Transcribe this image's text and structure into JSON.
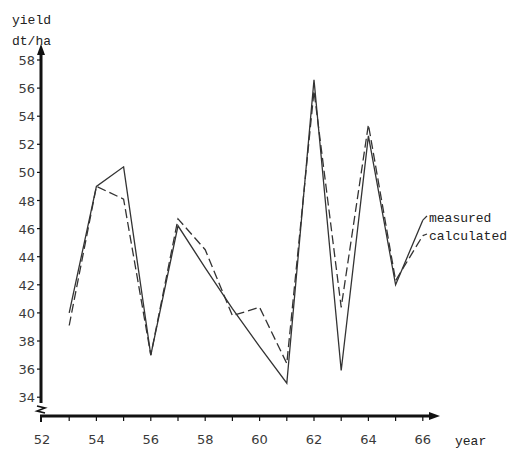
{
  "chart_data": {
    "type": "line",
    "title": "",
    "xlabel": "year",
    "ylabel_line1": "yield",
    "ylabel_line2": "dt/ha",
    "xlim": [
      52,
      66
    ],
    "ylim": [
      34,
      58
    ],
    "y_axis_break": true,
    "grid": false,
    "legend_position": "inline-right",
    "x_ticks": [
      52,
      54,
      56,
      58,
      60,
      62,
      64,
      66
    ],
    "x_minor_ticks": [
      53,
      55,
      57,
      59,
      61,
      63,
      65
    ],
    "y_ticks": [
      34,
      36,
      38,
      40,
      42,
      44,
      46,
      48,
      50,
      52,
      54,
      56,
      58
    ],
    "x": [
      53,
      54,
      55,
      56,
      57,
      58,
      59,
      60,
      61,
      62,
      63,
      64,
      65,
      66
    ],
    "series": [
      {
        "name": "measured",
        "style": "solid",
        "values": [
          40.0,
          49.0,
          50.4,
          37.0,
          46.2,
          43.2,
          40.3,
          37.6,
          35.0,
          56.6,
          35.9,
          52.6,
          42.0,
          46.6
        ]
      },
      {
        "name": "calculated",
        "style": "dashed",
        "values": [
          39.1,
          49.0,
          48.1,
          37.0,
          46.7,
          44.5,
          39.8,
          40.4,
          36.4,
          55.8,
          40.4,
          53.4,
          42.3,
          45.5
        ]
      }
    ]
  },
  "labels": {
    "yield": "yield",
    "unit": "dt/ha",
    "year": "year",
    "measured": "measured",
    "calculated": "calculated"
  },
  "colors": {
    "axis": "#111111",
    "line": "#333333",
    "text": "#3a3a3a"
  }
}
